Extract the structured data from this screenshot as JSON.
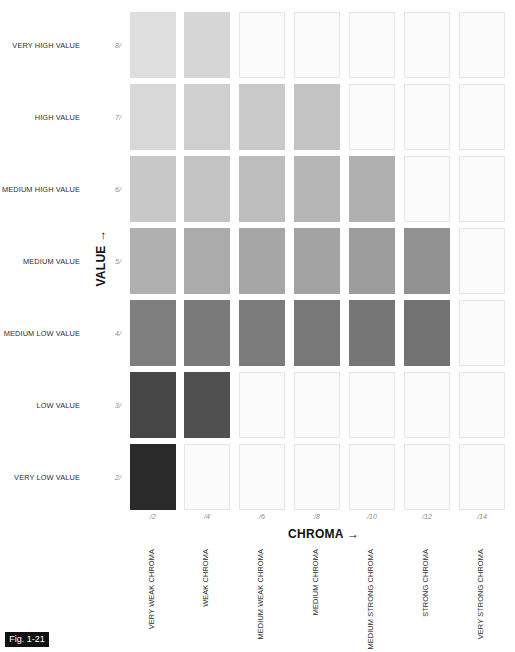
{
  "chart_data": {
    "type": "heatmap",
    "xlabel": "CHROMA →",
    "ylabel": "VALUE →",
    "x_ticks": [
      "/2",
      "/4",
      "/6",
      "/8",
      "/10",
      "/12",
      "/14"
    ],
    "x_labels": [
      "VERY WEAK CHROMA",
      "WEAK CHROMA",
      "MEDIUM WEAK CHROMA",
      "MEDIUM CHROMA",
      "MEDIUM STRONG CHROMA",
      "STRONG CHROMA",
      "VERY STRONG CHROMA"
    ],
    "y_ticks": [
      "8/",
      "7/",
      "6/",
      "5/",
      "4/",
      "3/",
      "2/"
    ],
    "y_labels": [
      "VERY HIGH VALUE",
      "HIGH VALUE",
      "MEDIUM HIGH VALUE",
      "MEDIUM VALUE",
      "MEDIUM LOW VALUE",
      "LOW VALUE",
      "VERY LOW VALUE"
    ],
    "filled_counts": [
      2,
      4,
      5,
      6,
      6,
      2,
      1
    ],
    "cells": [
      [
        "#dedede",
        "#d6d6d6",
        null,
        null,
        null,
        null,
        null
      ],
      [
        "#d8d8d8",
        "#cfcfcf",
        "#c9c9c9",
        "#c4c4c4",
        null,
        null,
        null
      ],
      [
        "#c8c8c8",
        "#c3c3c3",
        "#bdbdbd",
        "#b6b6b6",
        "#b0b0b0",
        null,
        null
      ],
      [
        "#b0b0b0",
        "#ababab",
        "#a6a6a6",
        "#a3a3a3",
        "#9c9c9c",
        "#929292",
        null
      ],
      [
        "#7e7e7e",
        "#7a7a7a",
        "#7b7b7b",
        "#787878",
        "#767676",
        "#727272",
        null
      ],
      [
        "#474747",
        "#505050",
        null,
        null,
        null,
        null,
        null
      ],
      [
        "#2a2a2a",
        null,
        null,
        null,
        null,
        null,
        null
      ]
    ]
  },
  "rows": [
    {
      "label": "VERY HIGH VALUE",
      "num": "8/"
    },
    {
      "label": "HIGH VALUE",
      "num": "7/"
    },
    {
      "label": "MEDIUM HIGH VALUE",
      "num": "6/"
    },
    {
      "label": "MEDIUM VALUE",
      "num": "5/"
    },
    {
      "label": "MEDIUM LOW VALUE",
      "num": "4/"
    },
    {
      "label": "LOW VALUE",
      "num": "3/"
    },
    {
      "label": "VERY LOW VALUE",
      "num": "2/"
    }
  ],
  "columns": [
    {
      "num": "/2",
      "label": "VERY WEAK CHROMA"
    },
    {
      "num": "/4",
      "label": "WEAK CHROMA"
    },
    {
      "num": "/6",
      "label": "MEDIUM WEAK CHROMA"
    },
    {
      "num": "/8",
      "label": "MEDIUM CHROMA"
    },
    {
      "num": "/10",
      "label": "MEDIUM STRONG CHROMA"
    },
    {
      "num": "/12",
      "label": "STRONG CHROMA"
    },
    {
      "num": "/14",
      "label": "VERY STRONG CHROMA"
    }
  ],
  "axes": {
    "chroma": "CHROMA →",
    "value": "VALUE →"
  },
  "figure": {
    "label": "Fig. 1-21"
  }
}
